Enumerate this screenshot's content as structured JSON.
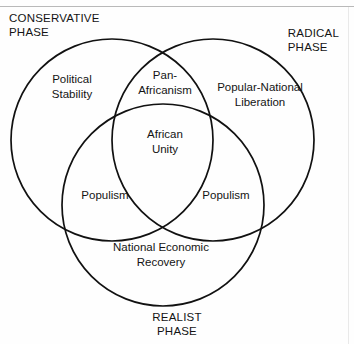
{
  "diagram": {
    "title_regions": {
      "conservative_phase": "CONSERVATIVE\nPHASE",
      "radical_phase": "RADICAL\nPHASE",
      "realist_phase": "REALIST\nPHASE"
    },
    "sets": [
      {
        "id": "conservative",
        "corner_label": "CONSERVATIVE PHASE",
        "exclusive_label": "Political\nStability"
      },
      {
        "id": "radical",
        "corner_label": "RADICAL PHASE",
        "exclusive_label": "Popular-National\nLiberation"
      },
      {
        "id": "realist",
        "corner_label": "REALIST PHASE",
        "exclusive_label": "National Economic\nRecovery"
      }
    ],
    "intersections": [
      {
        "id": "conservative-radical",
        "label": "Pan-\nAfricanism"
      },
      {
        "id": "conservative-realist",
        "label": "Populism"
      },
      {
        "id": "radical-realist",
        "label": "Populism"
      },
      {
        "id": "all-three",
        "label": "African\nUnity"
      }
    ],
    "stroke_color": "#111111",
    "background_color": "#fefefe"
  }
}
